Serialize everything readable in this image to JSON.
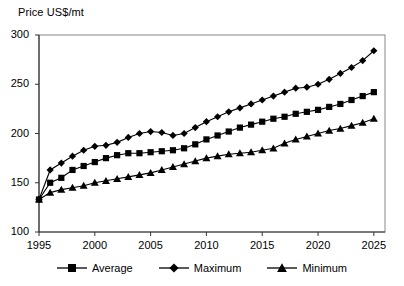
{
  "chart_data": {
    "type": "line",
    "title": "Price US$/mt",
    "xlabel": "",
    "ylabel": "Price US$/mt",
    "xlim": [
      1995,
      2026
    ],
    "ylim": [
      100,
      300
    ],
    "xticks": [
      1995,
      2000,
      2005,
      2010,
      2015,
      2020,
      2025
    ],
    "yticks": [
      100,
      150,
      200,
      250,
      300
    ],
    "grid": false,
    "legend_position": "bottom",
    "x": [
      1995,
      1996,
      1997,
      1998,
      1999,
      2000,
      2001,
      2002,
      2003,
      2004,
      2005,
      2006,
      2007,
      2008,
      2009,
      2010,
      2011,
      2012,
      2013,
      2014,
      2015,
      2016,
      2017,
      2018,
      2019,
      2020,
      2021,
      2022,
      2023,
      2024,
      2025
    ],
    "series": [
      {
        "name": "Average",
        "marker": "square",
        "color": "#000000",
        "values": [
          133,
          150,
          155,
          163,
          167,
          171,
          175,
          178,
          180,
          180,
          181,
          182,
          183,
          185,
          189,
          194,
          198,
          202,
          206,
          209,
          212,
          215,
          217,
          220,
          222,
          224,
          227,
          230,
          234,
          238,
          242
        ]
      },
      {
        "name": "Maximum",
        "marker": "diamond",
        "color": "#000000",
        "values": [
          133,
          163,
          170,
          177,
          183,
          187,
          188,
          191,
          196,
          200,
          202,
          201,
          198,
          200,
          206,
          212,
          217,
          222,
          226,
          230,
          234,
          238,
          242,
          246,
          247,
          250,
          255,
          261,
          267,
          274,
          284
        ]
      },
      {
        "name": "Minimum",
        "marker": "triangle",
        "color": "#000000",
        "values": [
          133,
          140,
          143,
          145,
          147,
          150,
          152,
          154,
          156,
          158,
          160,
          163,
          166,
          169,
          172,
          175,
          177,
          179,
          180,
          181,
          183,
          185,
          190,
          194,
          197,
          200,
          203,
          205,
          208,
          211,
          215
        ]
      }
    ]
  },
  "legend": {
    "items": [
      {
        "label": "Average",
        "marker": "square"
      },
      {
        "label": "Maximum",
        "marker": "diamond"
      },
      {
        "label": "Minimum",
        "marker": "triangle"
      }
    ]
  }
}
